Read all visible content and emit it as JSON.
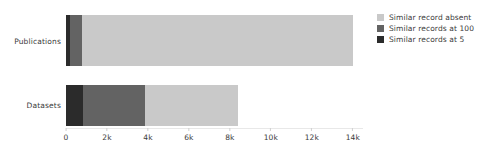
{
  "chart_data": {
    "type": "bar",
    "orientation": "horizontal",
    "stacked": true,
    "title": "",
    "xlabel": "",
    "ylabel": "",
    "categories": [
      "Publications",
      "Datasets"
    ],
    "series": [
      {
        "name": "Similar records at 5",
        "color": "#2b2b2b",
        "values": [
          200,
          830
        ]
      },
      {
        "name": "Similar records at 100",
        "color": "#636363",
        "values": [
          580,
          3020
        ]
      },
      {
        "name": "Similar record absent",
        "color": "#c9c9c9",
        "values": [
          13220,
          4550
        ]
      }
    ],
    "totals": [
      14000,
      8400
    ],
    "xlim": [
      0,
      14500
    ],
    "xticks": [
      0,
      2000,
      4000,
      6000,
      8000,
      10000,
      12000,
      14000
    ],
    "xtick_labels": [
      "0",
      "2k",
      "4k",
      "6k",
      "8k",
      "10k",
      "12k",
      "14k"
    ],
    "grid": false,
    "legend_position": "top-right",
    "legend_order": [
      "Similar record absent",
      "Similar records at 100",
      "Similar records at 5"
    ],
    "background_color": "#ffffff"
  },
  "legend": {
    "items": [
      {
        "label": "Similar record absent",
        "color": "#c9c9c9"
      },
      {
        "label": "Similar records at 100",
        "color": "#636363"
      },
      {
        "label": "Similar records at 5",
        "color": "#2b2b2b"
      }
    ]
  },
  "axis": {
    "categories": [
      {
        "label": "Publications"
      },
      {
        "label": "Datasets"
      }
    ],
    "xtick_labels": [
      "0",
      "2k",
      "4k",
      "6k",
      "8k",
      "10k",
      "12k",
      "14k"
    ]
  }
}
